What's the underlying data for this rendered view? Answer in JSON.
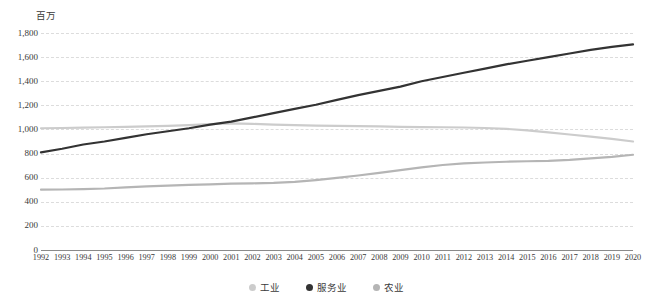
{
  "chart_data": {
    "type": "line",
    "title": "",
    "subtitle": "",
    "unit_label": "百万",
    "xlabel": "",
    "ylabel": "",
    "ylim": [
      0,
      1800
    ],
    "ytick_step": 200,
    "grid": true,
    "legend_position": "bottom",
    "yticks": [
      "1,800",
      "1,600",
      "1,400",
      "1,200",
      "1,000",
      "800",
      "600",
      "400",
      "200",
      "0"
    ],
    "ytick_values": [
      1800,
      1600,
      1400,
      1200,
      1000,
      800,
      600,
      400,
      200,
      0
    ],
    "categories": [
      "1992",
      "1993",
      "1994",
      "1995",
      "1996",
      "1997",
      "1998",
      "1999",
      "2000",
      "2001",
      "2002",
      "2003",
      "2004",
      "2005",
      "2006",
      "2007",
      "2008",
      "2009",
      "2010",
      "2011",
      "2012",
      "2013",
      "2014",
      "2015",
      "2016",
      "2017",
      "2018",
      "2019",
      "2020"
    ],
    "x": [
      1992,
      1993,
      1994,
      1995,
      1996,
      1997,
      1998,
      1999,
      2000,
      2001,
      2002,
      2003,
      2004,
      2005,
      2006,
      2007,
      2008,
      2009,
      2010,
      2011,
      2012,
      2013,
      2014,
      2015,
      2016,
      2017,
      2018,
      2019,
      2020
    ],
    "series": [
      {
        "name": "工业",
        "color": "#cccccc",
        "values": [
          1010,
          1012,
          1015,
          1018,
          1022,
          1026,
          1030,
          1036,
          1044,
          1050,
          1046,
          1040,
          1036,
          1032,
          1030,
          1028,
          1026,
          1022,
          1020,
          1018,
          1016,
          1012,
          1005,
          992,
          975,
          958,
          940,
          922,
          900
        ]
      },
      {
        "name": "服务业",
        "color": "#333333",
        "values": [
          810,
          840,
          875,
          900,
          930,
          960,
          985,
          1010,
          1040,
          1065,
          1100,
          1135,
          1170,
          1205,
          1245,
          1285,
          1320,
          1355,
          1400,
          1435,
          1470,
          1505,
          1540,
          1570,
          1600,
          1630,
          1660,
          1685,
          1705
        ]
      },
      {
        "name": "农业",
        "color": "#b5b5b5",
        "values": [
          500,
          502,
          505,
          510,
          520,
          528,
          534,
          540,
          545,
          550,
          553,
          556,
          565,
          580,
          598,
          618,
          640,
          662,
          685,
          705,
          718,
          726,
          732,
          736,
          740,
          748,
          760,
          772,
          790
        ]
      }
    ]
  },
  "legend": {
    "items": [
      {
        "label": "工业",
        "color": "#cccccc"
      },
      {
        "label": "服务业",
        "color": "#333333"
      },
      {
        "label": "农业",
        "color": "#b5b5b5"
      }
    ]
  }
}
